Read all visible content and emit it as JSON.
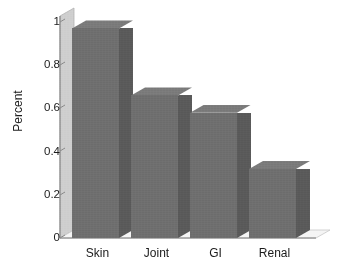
{
  "chart_data": {
    "type": "bar",
    "title": "",
    "subtitle": "",
    "xlabel": "",
    "ylabel": "Percent",
    "categories": [
      "Skin",
      "Joint",
      "GI",
      "Renal"
    ],
    "values": [
      0.97,
      0.66,
      0.58,
      0.32
    ],
    "series": [
      {
        "name": "Percent",
        "values": [
          0.97,
          0.66,
          0.58,
          0.32
        ]
      }
    ],
    "ylim": [
      0,
      1
    ],
    "yticks": [
      "0",
      "0.2",
      "0.4",
      "0.6",
      "0.8",
      "1"
    ],
    "ytick_values": [
      0,
      0.2,
      0.4,
      0.6,
      0.8,
      1
    ],
    "grid": false,
    "legend": false,
    "legend_position": "none",
    "style": "3d-bar-grayscale",
    "colors": {
      "bar_front": "#6f6f6f",
      "bar_side": "#5a5a5a",
      "bar_top": "#7b7b7b",
      "wall": "#cfcfcf",
      "floor": "#f2f2f2",
      "text": "#1b1b1b",
      "background": "#ffffff"
    }
  }
}
